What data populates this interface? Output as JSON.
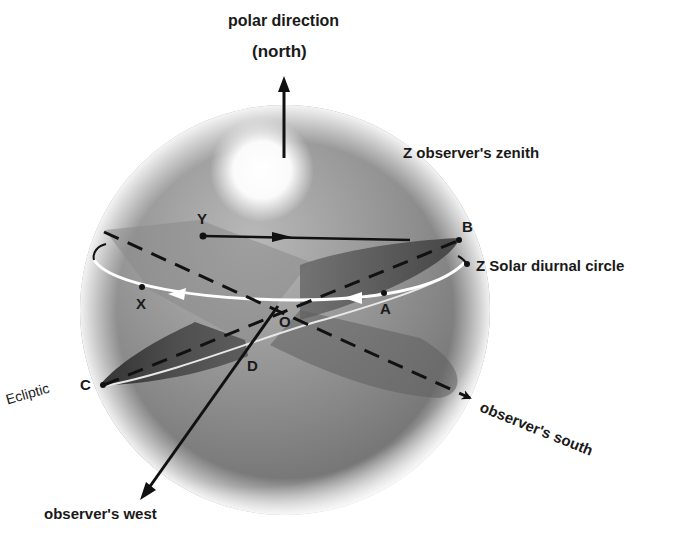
{
  "diagram": {
    "title_top": "polar direction",
    "title_top_sub": "(north)",
    "labels": {
      "zenith": "Z  observer's zenith",
      "solar_circle": "Z Solar  diurnal  circle",
      "ecliptic": "Ecliptic",
      "south": "observer's  south",
      "west": "observer's   west"
    },
    "points": {
      "Y": "Y",
      "B": "B",
      "X": "X",
      "A": "A",
      "O": "O",
      "D": "D",
      "C": "C"
    },
    "colors": {
      "sphere_dark": "#6e6e6e",
      "sphere_mid": "#9a9a9a",
      "sphere_light": "#c8c8c8",
      "plane_dark": "#3c3c3c",
      "line": "#111111",
      "circle_white": "#ffffff",
      "text": "#1a1a1a"
    }
  }
}
